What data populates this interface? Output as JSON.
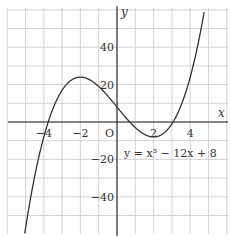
{
  "chart_data": {
    "type": "line",
    "title": "",
    "xlabel": "x",
    "ylabel": "y",
    "origin_label": "O",
    "equation": "y = x³ − 12x + 8",
    "xlim": [
      -6,
      6
    ],
    "ylim": [
      -60,
      60
    ],
    "grid": true,
    "x_ticks": [
      -4,
      -2,
      2,
      4
    ],
    "x_tick_labels": [
      "−4",
      "−2",
      "2",
      "4"
    ],
    "y_ticks": [
      40,
      20,
      -20,
      -40
    ],
    "y_tick_labels": [
      "40",
      "20",
      "−20",
      "−40"
    ],
    "series": [
      {
        "name": "y = x³ − 12x + 8",
        "function": "x^3 - 12x + 8",
        "x": [
          -5,
          -4.5,
          -4,
          -3.5,
          -3,
          -2.5,
          -2,
          -1.5,
          -1,
          -0.5,
          0,
          0.5,
          1,
          1.5,
          2,
          2.5,
          3,
          3.5,
          4,
          4.5
        ],
        "y": [
          -57,
          -29.1,
          -8,
          7.1,
          17,
          22.4,
          24,
          22.6,
          19,
          13.9,
          8,
          2.1,
          -3,
          -6.6,
          -8,
          -6.4,
          -1,
          8.9,
          24,
          45.1
        ]
      }
    ]
  }
}
